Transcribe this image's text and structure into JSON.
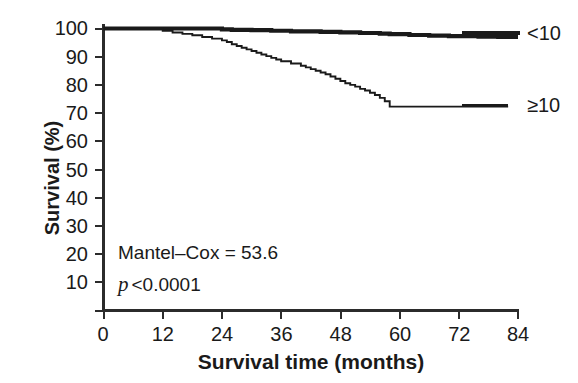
{
  "chart_data": {
    "type": "line",
    "title": "",
    "xlabel": "Survival time (months)",
    "ylabel": "Survival (%)",
    "xlim": [
      0,
      84
    ],
    "ylim": [
      0,
      100
    ],
    "xticks": [
      0,
      12,
      24,
      36,
      48,
      60,
      72,
      84
    ],
    "yticks": [
      10,
      20,
      30,
      40,
      50,
      60,
      70,
      80,
      90,
      100
    ],
    "grid": false,
    "legend_position": "right",
    "series": [
      {
        "name": "<10",
        "style": "thick",
        "color": "#1a1a1a",
        "x": [
          0,
          22,
          24,
          26,
          30,
          34,
          38,
          44,
          48,
          52,
          56,
          58,
          62,
          66,
          70,
          76,
          80,
          84
        ],
        "y": [
          100,
          100,
          99.7,
          99.5,
          99.4,
          99.2,
          99.0,
          98.8,
          98.6,
          98.4,
          98.2,
          98.0,
          97.7,
          97.5,
          97.3,
          97.1,
          97.0,
          97.0
        ]
      },
      {
        "name": "≥10",
        "style": "thin",
        "color": "#1a1a1a",
        "x": [
          0,
          10,
          12,
          14,
          16,
          18,
          20,
          22,
          24,
          25,
          26,
          27,
          28,
          29,
          30,
          31,
          32,
          33,
          34,
          35,
          36,
          38,
          40,
          41,
          42,
          43,
          44,
          45,
          46,
          47,
          48,
          49,
          50,
          51,
          52,
          53,
          54,
          55,
          56,
          57,
          58,
          60,
          66,
          72,
          78,
          82
        ],
        "y": [
          100,
          100,
          99.2,
          98.6,
          98.1,
          97.6,
          97.0,
          96.4,
          95.8,
          95.2,
          94.4,
          93.8,
          93.2,
          92.6,
          92.0,
          91.4,
          90.8,
          90.2,
          89.6,
          89.0,
          88.4,
          87.6,
          86.8,
          86.2,
          85.6,
          85.0,
          84.4,
          83.8,
          83.0,
          82.2,
          81.4,
          80.6,
          80.0,
          79.4,
          78.6,
          78.0,
          77.2,
          76.4,
          75.4,
          74.2,
          72.3,
          72.3,
          72.3,
          72.3,
          72.3,
          72.3
        ]
      }
    ],
    "annotations": [
      {
        "id": "mantel-cox",
        "text": "Mantel–Cox = 53.6"
      },
      {
        "id": "p-value",
        "symbol": "p",
        "text": "<0.0001"
      }
    ]
  },
  "axis": {
    "y_tick_labels": [
      "100",
      "90",
      "80",
      "70",
      "60",
      "50",
      "40",
      "30",
      "20",
      "10"
    ],
    "x_tick_labels": [
      "0",
      "12",
      "24",
      "36",
      "48",
      "60",
      "72",
      "84"
    ]
  },
  "legend": {
    "entries": [
      {
        "label": "<10"
      },
      {
        "label": "≥10"
      }
    ]
  },
  "colors": {
    "axis": "#2b2b2b",
    "curve": "#1a1a1a",
    "background": "#ffffff"
  }
}
